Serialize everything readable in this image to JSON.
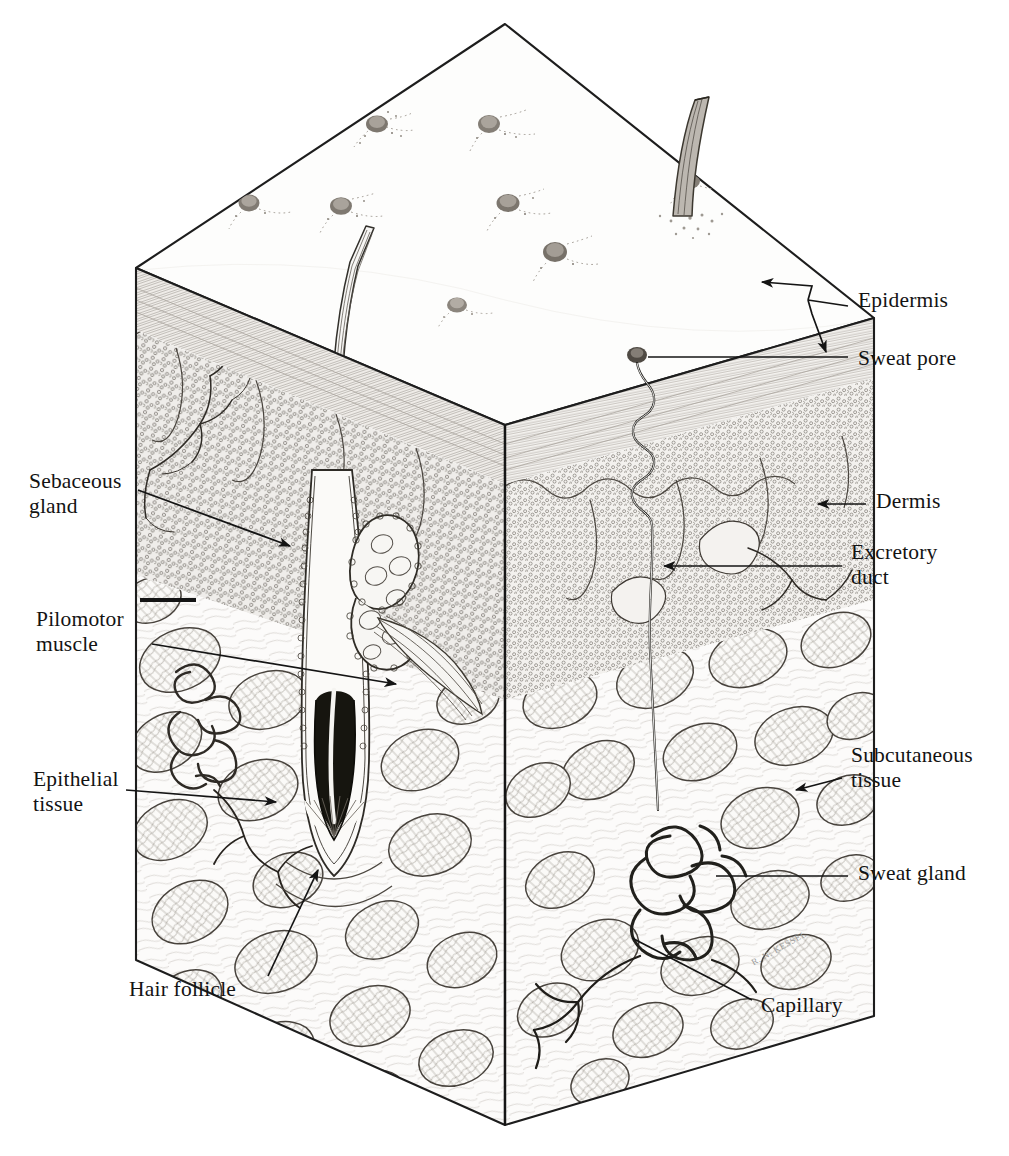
{
  "figure": {
    "kind": "anatomical-illustration",
    "medium": "pen-and-ink line drawing",
    "artist_signature": "R. N. KESSEL",
    "background_color": "#ffffff",
    "ink_color": "#1a1a1a"
  },
  "labels": {
    "epidermis": "Epidermis",
    "sweat_pore": "Sweat  pore",
    "dermis": "Dermis",
    "excretory_duct": "Excretory\nduct",
    "subcutaneous_tissue": "Subcutaneous\ntissue",
    "sweat_gland": "Sweat  gland",
    "capillary": "Capillary",
    "hair_follicle": "Hair  follicle",
    "epithelial_tissue": "Epithelial\ntissue",
    "pilomotor_muscle": "Pilomotor\nmuscle",
    "sebaceous_gland": "Sebaceous\ngland"
  },
  "layers": [
    {
      "name": "Epidermis",
      "order": 1,
      "texture": "fine parallel hatching",
      "fill": "#f2f0ec"
    },
    {
      "name": "Dermis",
      "order": 2,
      "texture": "dense stippled cellular rings",
      "fill": "#eceae6"
    },
    {
      "name": "Subcutaneous tissue",
      "order": 3,
      "texture": "fat lobules / adipose cells",
      "fill": "#fafafa"
    }
  ],
  "structures": [
    {
      "name": "Hair shaft",
      "location": "top surface, right of center"
    },
    {
      "name": "Hair follicle",
      "location": "left-center, descends into subcutaneous tissue"
    },
    {
      "name": "Hair bulb with papilla",
      "location": "base of follicle"
    },
    {
      "name": "Sebaceous gland",
      "location": "upper dermis beside follicle"
    },
    {
      "name": "Pilomotor muscle",
      "location": "dermis, attached to follicle"
    },
    {
      "name": "Sweat pore",
      "location": "epidermal surface, right panel"
    },
    {
      "name": "Excretory duct",
      "location": "spiral duct from pore down through dermis"
    },
    {
      "name": "Sweat gland",
      "location": "coiled glomerulus in subcutaneous tissue"
    },
    {
      "name": "Capillary",
      "location": "vessel network supplying sweat gland"
    },
    {
      "name": "Epithelial tissue",
      "location": "left cut face, mid depth"
    },
    {
      "name": "Sweat pores",
      "count": 8,
      "location": "scattered across top surface"
    }
  ],
  "label_positions": {
    "epidermis": {
      "x": 858,
      "y": 299,
      "side": "right"
    },
    "sweat_pore": {
      "x": 858,
      "y": 357,
      "side": "right"
    },
    "dermis": {
      "x": 876,
      "y": 497,
      "side": "right"
    },
    "excretory_duct": {
      "x": 851,
      "y": 548,
      "side": "right"
    },
    "subcutaneous_tissue": {
      "x": 851,
      "y": 750,
      "side": "right"
    },
    "sweat_gland": {
      "x": 858,
      "y": 869,
      "side": "right"
    },
    "capillary": {
      "x": 761,
      "y": 1000,
      "side": "right"
    },
    "hair_follicle": {
      "x": 129,
      "y": 984,
      "side": "bottom"
    },
    "epithelial_tissue": {
      "x": 33,
      "y": 774,
      "side": "left"
    },
    "pilomotor_muscle": {
      "x": 36,
      "y": 614,
      "side": "left"
    },
    "sebaceous_gland": {
      "x": 29,
      "y": 476,
      "side": "left"
    }
  }
}
